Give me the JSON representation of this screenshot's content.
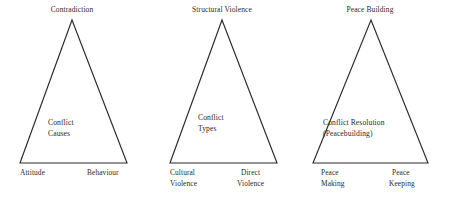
{
  "figure": {
    "background_color": "#ffffff",
    "stroke_color": "#2b2b2b",
    "text_color": "#2d2a28"
  },
  "triangles": [
    {
      "id": "conflict-causes-triangle",
      "apex_label": "Contradiction",
      "inner_label_line1": "Conflict",
      "inner_label_line2": "Causes",
      "bottom_left_line1": "Attitude",
      "bottom_left_line2": "",
      "bottom_right_line1": "Behaviour",
      "bottom_right_line2": "",
      "geometry": {
        "apex_x": 72,
        "apex_y": 20,
        "base_y": 163,
        "base_left_x": 20,
        "base_right_x": 127
      }
    },
    {
      "id": "conflict-types-triangle",
      "apex_label": "Structural Violence",
      "inner_label_line1": "Conflict",
      "inner_label_line2": "Types",
      "bottom_left_line1": "Cultural",
      "bottom_left_line2": "Violence",
      "bottom_right_line1": "Direct",
      "bottom_right_line2": "Violence",
      "geometry": {
        "apex_x": 222,
        "apex_y": 20,
        "base_y": 163,
        "base_left_x": 170,
        "base_right_x": 277
      }
    },
    {
      "id": "conflict-resolution-triangle",
      "apex_label": "Peace Building",
      "inner_label_line1": "Conflict Resolution",
      "inner_label_line2": "(Peacebuilding)",
      "bottom_left_line1": "Peace",
      "bottom_left_line2": "Making",
      "bottom_right_line1": "Peace",
      "bottom_right_line2": "Keeping",
      "geometry": {
        "apex_x": 371,
        "apex_y": 20,
        "base_y": 163,
        "base_left_x": 313,
        "base_right_x": 428
      }
    }
  ]
}
